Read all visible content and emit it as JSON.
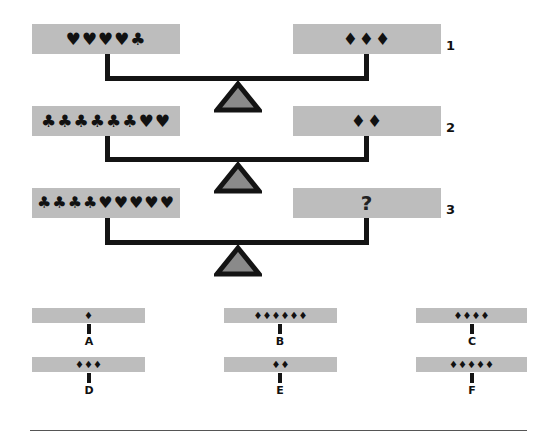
{
  "puzzle": {
    "rows": [
      {
        "number": "1",
        "left": "♥♥♥♥♣",
        "right": "♦♦♦"
      },
      {
        "number": "2",
        "left": "♣♣♣♣♣♣♥♥",
        "right": "♦♦"
      },
      {
        "number": "3",
        "left": "♣♣♣♣♥♥♥♥♥",
        "right": "?"
      }
    ],
    "options": [
      {
        "letter": "A",
        "symbols": "♦"
      },
      {
        "letter": "B",
        "symbols": "♦♦♦♦♦♦"
      },
      {
        "letter": "C",
        "symbols": "♦♦♦♦"
      },
      {
        "letter": "D",
        "symbols": "♦♦♦"
      },
      {
        "letter": "E",
        "symbols": "♦♦"
      },
      {
        "letter": "F",
        "symbols": "♦♦♦♦♦"
      }
    ],
    "icons": {
      "fulcrum": "triangle-fulcrum-icon",
      "heart": "♥",
      "club": "♣",
      "diamond": "♦"
    },
    "colors": {
      "pan": "#bdbdbd",
      "beam": "#141414",
      "fulcrum_fill": "#8a8a8a",
      "fulcrum_stroke": "#141414"
    }
  }
}
